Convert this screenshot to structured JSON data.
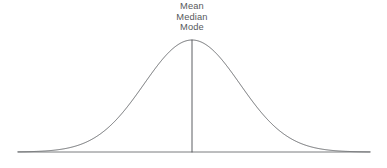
{
  "figure": {
    "background_color": "#ffffff",
    "width": 387,
    "height": 168
  },
  "annotations": {
    "center_label_lines": [
      "Mean",
      "Median",
      "Mode"
    ],
    "line_1": "Mean",
    "line_2": "Median",
    "line_3": "Mode",
    "text_color": "#56595c"
  },
  "chart_data": {
    "type": "line",
    "title": "",
    "subtitle": "",
    "xlabel": "",
    "ylabel": "",
    "grid": false,
    "legend": null,
    "legend_position": "none",
    "distribution": {
      "name": "normal",
      "mean_px": 192,
      "sigma_px": 48,
      "peak_x_px": 192,
      "peak_y_px": 40,
      "baseline_y_px": 152,
      "amplitude_px": 112
    },
    "axis": {
      "baseline_x_start_px": 18,
      "baseline_x_end_px": 370,
      "baseline_y_px": 152,
      "xlim_px": [
        18,
        370
      ],
      "ylim_px": [
        152,
        40
      ],
      "tick_labels": [],
      "axis_color": "#6b6e71"
    },
    "center_line": {
      "x_px": 192,
      "y_top_px": 40,
      "y_bottom_px": 152,
      "color": "#4a4d50",
      "label": "Mean / Median / Mode"
    },
    "series": [
      {
        "name": "normal curve",
        "color": "#5c5f62",
        "x": [
          18,
          30,
          42,
          54,
          66,
          78,
          90,
          102,
          114,
          126,
          138,
          150,
          162,
          174,
          186,
          192,
          198,
          210,
          222,
          234,
          246,
          258,
          270,
          282,
          294,
          306,
          318,
          330,
          342,
          354,
          366,
          370
        ],
        "y": [
          152.0,
          151.9,
          151.6,
          150.9,
          149.5,
          147.1,
          143.2,
          137.4,
          129.3,
          118.9,
          106.3,
          92.0,
          76.9,
          62.2,
          49.9,
          45.3,
          42.2,
          40.6,
          45.3,
          54.4,
          67.4,
          82.6,
          98.3,
          113.0,
          125.6,
          135.4,
          142.4,
          147.0,
          149.8,
          151.3,
          151.9,
          152.0
        ]
      }
    ]
  }
}
